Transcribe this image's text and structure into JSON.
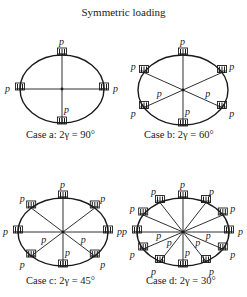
{
  "figure": {
    "title": "Symmetric loading",
    "load_label": "p",
    "stroke_color": "#1a1a1a",
    "cases": [
      {
        "id": "a",
        "caption": "Case a: 2γ = 90°",
        "angle_deg": 90,
        "cx": 62,
        "cy": 89,
        "rx": 42,
        "ry": 34,
        "caption_x": 26,
        "caption_y": 129
      },
      {
        "id": "b",
        "caption": "Case b: 2γ = 60°",
        "angle_deg": 60,
        "cx": 183,
        "cy": 90,
        "rx": 45,
        "ry": 35,
        "caption_x": 144,
        "caption_y": 129
      },
      {
        "id": "c",
        "caption": "Case c: 2γ = 45°",
        "angle_deg": 45,
        "cx": 63,
        "cy": 232,
        "rx": 45,
        "ry": 34,
        "caption_x": 26,
        "caption_y": 275
      },
      {
        "id": "d",
        "caption": "Case d: 2γ = 30°",
        "angle_deg": 30,
        "cx": 183,
        "cy": 232,
        "rx": 46,
        "ry": 34,
        "caption_x": 146,
        "caption_y": 275
      }
    ]
  }
}
